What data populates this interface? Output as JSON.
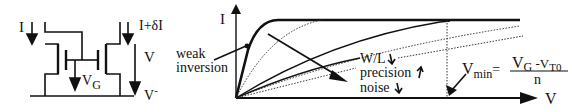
{
  "circuit": {
    "current_left": "I",
    "current_right": "I+δI",
    "voltage": "V",
    "gate_voltage_main": "V",
    "gate_voltage_sub": "G",
    "supply_main": "V",
    "supply_sup": "-"
  },
  "graph": {
    "y_axis_label": "I",
    "x_axis_label": "V",
    "weak_inversion_line1": "weak",
    "weak_inversion_line2": "inversion",
    "wl_label": "W/L",
    "precision_label": "precision",
    "noise_label": "noise",
    "vmin_main": "V",
    "vmin_sub": "min",
    "vmin_eq": "=",
    "numerator_v1": "V",
    "numerator_sub1": "G",
    "numerator_minus": " -V",
    "numerator_sub2": "T0",
    "denominator": "n"
  },
  "colors": {
    "ink": "#111111",
    "background": "#ffffff"
  }
}
